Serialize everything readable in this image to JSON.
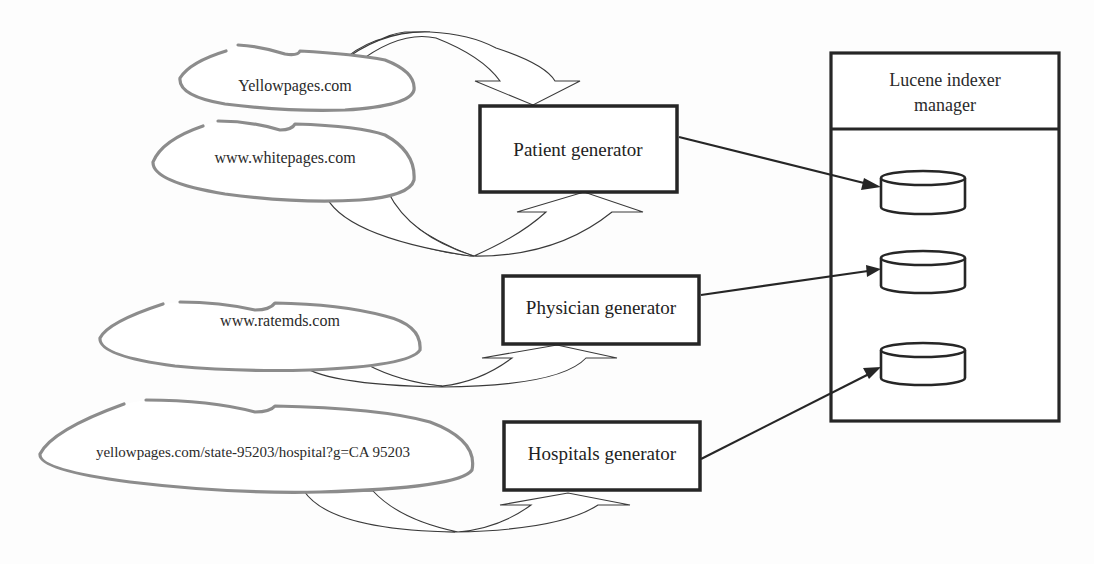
{
  "diagram": {
    "sources": [
      {
        "label": "Yellowpages.com",
        "feeds": "Patient generator"
      },
      {
        "label": "www.whitepages.com",
        "feeds": "Patient generator"
      },
      {
        "label": "www.ratemds.com",
        "feeds": "Physician generator"
      },
      {
        "label": "yellowpages.com/state-95203/hospital?g=CA 95203",
        "feeds": "Hospitals generator"
      }
    ],
    "generators": [
      {
        "label": "Patient generator"
      },
      {
        "label": "Physician generator"
      },
      {
        "label": "Hospitals generator"
      }
    ],
    "indexer": {
      "title_line1": "Lucene indexer",
      "title_line2": "manager",
      "databases": [
        {
          "name": "patient-index"
        },
        {
          "name": "physician-index"
        },
        {
          "name": "hospital-index"
        }
      ]
    },
    "colors": {
      "cloud_stroke": "#8c8c8c",
      "box_stroke": "#262626",
      "arrow_shade": "#dcdcdc",
      "background": "#fdfdfd"
    }
  }
}
